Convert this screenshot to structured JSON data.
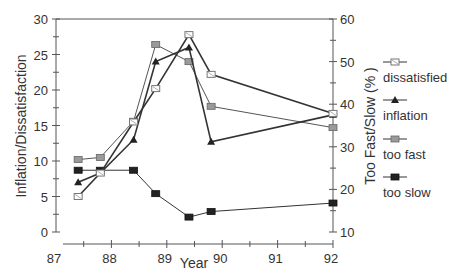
{
  "chart_data": {
    "type": "line",
    "title": "",
    "xlabel": "Year",
    "ylabel": "Inflation/Dissatisfaction",
    "ylabel_right": "Too Fast/Slow (% )",
    "xlim": [
      87,
      92
    ],
    "ylim": [
      0,
      30
    ],
    "ylim_right": [
      10,
      60
    ],
    "x_ticks": [
      "87",
      "88",
      "89",
      "90",
      "91",
      "92"
    ],
    "y_ticks": [
      "0",
      "5",
      "10",
      "15",
      "20",
      "25",
      "30"
    ],
    "y_ticks_right": [
      "10",
      "20",
      "30",
      "40",
      "50",
      "60"
    ],
    "grid": false,
    "legend_position": "right",
    "series": [
      {
        "name": "dissatisfied",
        "axis": "left",
        "marker": "open-square",
        "color": "#333333",
        "x": [
          87.4,
          87.8,
          88.4,
          88.8,
          89.4,
          89.8,
          92.0
        ],
        "values": [
          5.0,
          8.3,
          15.5,
          20.2,
          27.8,
          22.2,
          16.7
        ]
      },
      {
        "name": "inflation",
        "axis": "left",
        "marker": "triangle",
        "color": "#222222",
        "x": [
          87.4,
          87.8,
          88.4,
          88.8,
          89.4,
          89.8,
          92.0
        ],
        "values": [
          7.0,
          8.3,
          13.0,
          24.0,
          26.0,
          12.7,
          16.5
        ]
      },
      {
        "name": "too fast",
        "axis": "right",
        "marker": "gray-square",
        "color": "#888888",
        "x": [
          87.4,
          87.8,
          88.4,
          88.8,
          89.4,
          89.8,
          92.0
        ],
        "values": [
          27.0,
          27.5,
          36.0,
          54.0,
          50.0,
          39.5,
          34.5
        ]
      },
      {
        "name": "too slow",
        "axis": "right",
        "marker": "filled-square",
        "color": "#222222",
        "x": [
          87.4,
          87.8,
          88.4,
          88.8,
          89.4,
          89.8,
          92.0
        ],
        "values": [
          24.5,
          24.5,
          24.5,
          19.0,
          13.5,
          14.8,
          16.8
        ]
      }
    ]
  }
}
